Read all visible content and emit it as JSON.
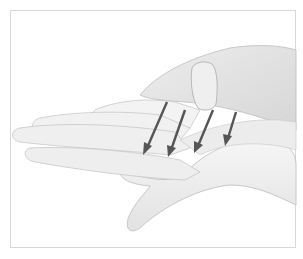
{
  "image": {
    "description": "Illustration of one hand resting palm-up on another hand with four arrows pointing down-left across the palm",
    "arrow_count": 4,
    "colors": {
      "background": "#ffffff",
      "frame_border": "#d8d8d8",
      "skin_light": "#f2f2f2",
      "skin_shadow": "#c9c9c9",
      "arrow": "#555555"
    }
  }
}
